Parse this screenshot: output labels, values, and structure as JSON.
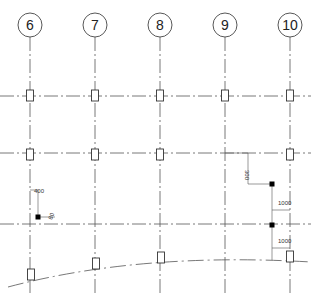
{
  "drawing": {
    "canvas": {
      "width": 311,
      "height": 294
    },
    "colors": {
      "line": "#555555",
      "bubble": "#444444",
      "column": "#333333",
      "marker": "#000000",
      "background": "#ffffff"
    },
    "grids": [
      {
        "label": "6",
        "x": 30
      },
      {
        "label": "7",
        "x": 95
      },
      {
        "label": "8",
        "x": 160
      },
      {
        "label": "9",
        "x": 225
      },
      {
        "label": "10",
        "x": 290
      }
    ],
    "bubble": {
      "cy": 25,
      "r": 12
    },
    "horizontal_grids": [
      {
        "y": 96
      },
      {
        "y": 153
      },
      {
        "y": 224
      }
    ],
    "columns": [
      {
        "x": 30,
        "y": 96
      },
      {
        "x": 95,
        "y": 96
      },
      {
        "x": 160,
        "y": 96
      },
      {
        "x": 225,
        "y": 96
      },
      {
        "x": 290,
        "y": 96
      },
      {
        "x": 30,
        "y": 155
      },
      {
        "x": 95,
        "y": 155
      },
      {
        "x": 160,
        "y": 155
      },
      {
        "x": 290,
        "y": 155
      },
      {
        "x": 31,
        "y": 275
      },
      {
        "x": 96,
        "y": 264
      },
      {
        "x": 161,
        "y": 258
      },
      {
        "x": 290,
        "y": 257
      }
    ],
    "curve": {
      "path": "M 8 287 Q 140 252 311 262"
    },
    "dimensions": [
      {
        "id": "dim-400",
        "text": "400",
        "x": 34,
        "y": 193,
        "rotate": 0
      },
      {
        "id": "dim-80",
        "text": "80",
        "x": 52,
        "y": 220,
        "rotate": -70
      },
      {
        "id": "dim-300",
        "text": "300",
        "x": 245,
        "y": 170,
        "rotate": 90
      },
      {
        "id": "dim-1000-a",
        "text": "1000",
        "x": 278,
        "y": 205,
        "rotate": 0
      },
      {
        "id": "dim-1000-b",
        "text": "1000",
        "x": 278,
        "y": 243,
        "rotate": 0
      }
    ],
    "markers": [
      {
        "x": 38,
        "y": 217
      },
      {
        "x": 272,
        "y": 184
      },
      {
        "x": 272,
        "y": 225
      }
    ]
  }
}
